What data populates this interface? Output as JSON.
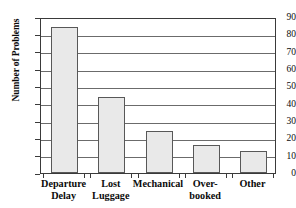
{
  "chart_data": {
    "type": "bar",
    "title": "",
    "subtitle": "",
    "xlabel": "",
    "ylabel": "Number of Problems",
    "categories": [
      "Departure\nDelay",
      "Lost\nLuggage",
      "Mechanical",
      "Over-\nbooked",
      "Other"
    ],
    "values": [
      84,
      44,
      24,
      16,
      12.5
    ],
    "ylim": [
      0,
      90
    ],
    "y_ticks": [
      0,
      10,
      20,
      30,
      40,
      50,
      60,
      70,
      80,
      90
    ],
    "y_tick_labels": [
      "0",
      "10",
      "20",
      "30",
      "40",
      "50",
      "60",
      "70",
      "80",
      "90"
    ],
    "grid": "horizontal",
    "legend": "none",
    "bar_fill_color": "#e9e9e9",
    "bar_border_color": "#585858",
    "gridline_color": "#6b6b6b",
    "axis_color": "#3a3a3a",
    "background_color": "#ffffff",
    "annotations": []
  }
}
